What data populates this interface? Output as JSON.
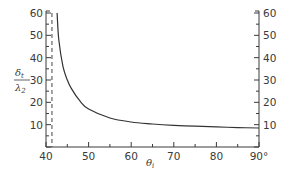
{
  "chart_data": {
    "type": "line",
    "title": "",
    "xlabel": "θi",
    "ylabel": "δt / λ2",
    "xlim": [
      40,
      90
    ],
    "ylim": [
      0,
      60
    ],
    "x_ticks": [
      "40",
      "50",
      "60",
      "70",
      "80",
      "90°"
    ],
    "y_ticks_left": [
      "10",
      "20",
      "30",
      "40",
      "50",
      "60"
    ],
    "y_ticks_right": [
      "10",
      "20",
      "30",
      "40",
      "50",
      "60"
    ],
    "grid": false,
    "annotations": [
      {
        "type": "vertical-dashed-line",
        "x": 41.4,
        "meaning": "critical angle asymptote"
      }
    ],
    "series": [
      {
        "name": "penetration depth",
        "x": [
          42.6,
          43,
          44,
          45,
          46,
          48,
          50,
          55,
          60,
          65,
          70,
          75,
          80,
          85,
          90
        ],
        "values": [
          60,
          48,
          36,
          30,
          26,
          20.5,
          17,
          13,
          11.2,
          10.3,
          9.7,
          9.3,
          9.0,
          8.7,
          8.5
        ]
      }
    ]
  },
  "axes": {
    "x_label_main": "θ",
    "x_label_sub": "i",
    "y_label_num": "δ",
    "y_label_num_sub": "t",
    "y_label_den": "λ",
    "y_label_den_sub": "2"
  }
}
